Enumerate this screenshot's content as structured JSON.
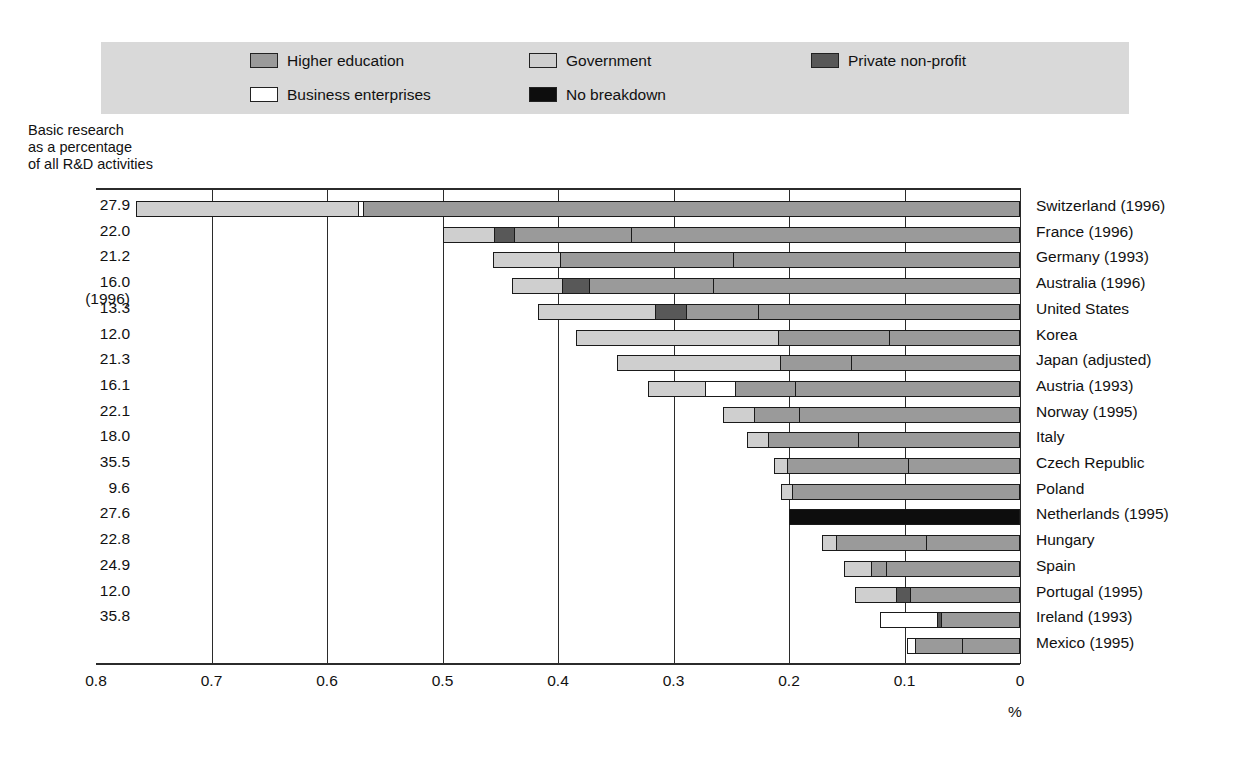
{
  "legend": {
    "items": [
      {
        "label": "Higher education",
        "color": "#9a9a9a",
        "key": "higher_education",
        "col": 0,
        "row": 0
      },
      {
        "label": "Business enterprises",
        "color": "#ffffff",
        "key": "business_enterprises",
        "col": 0,
        "row": 1
      },
      {
        "label": "Government",
        "color": "#cfcfcf",
        "key": "government",
        "col": 1,
        "row": 0
      },
      {
        "label": "No breakdown",
        "color": "#0d0d0d",
        "key": "no_breakdown",
        "col": 1,
        "row": 1
      },
      {
        "label": "Private non-profit",
        "color": "#585858",
        "key": "private_non_profit",
        "col": 2,
        "row": 0
      }
    ],
    "background": "#d9d9d9"
  },
  "axis_caption": "Basic research\nas a percentage\nof all R&D activities",
  "unit_label": "%",
  "chart_data": {
    "type": "bar",
    "title": "Basic research as a percentage of all R&D activities",
    "subtype": "stacked-horizontal",
    "xlabel": "%",
    "ylabel": "",
    "xlim": [
      0.8,
      0.0
    ],
    "xticks": [
      "0.8",
      "0.7",
      "0.6",
      "0.5",
      "0.4",
      "0.3",
      "0.2",
      "0.1",
      "0"
    ],
    "xtick_values": [
      0.8,
      0.7,
      0.6,
      0.5,
      0.4,
      0.3,
      0.2,
      0.1,
      0.0
    ],
    "axis_reversed": true,
    "grid": true,
    "legend_position": "top",
    "series": [
      {
        "name": "Government",
        "color": "#cfcfcf"
      },
      {
        "name": "Private non-profit",
        "color": "#585858"
      },
      {
        "name": "Business enterprises",
        "color": "#ffffff"
      },
      {
        "name": "Higher education",
        "color": "#9a9a9a"
      },
      {
        "name": "No breakdown",
        "color": "#0d0d0d"
      }
    ],
    "categories": [
      "Switzerland (1996)",
      "France (1996)",
      "Germany (1993)",
      "Australia (1996)",
      "United States",
      "Korea",
      "Japan (adjusted)",
      "Austria (1993)",
      "Norway (1995)",
      "Italy",
      "Czech Republic",
      "Poland",
      "Netherlands (1995)",
      "Hungary",
      "Spain",
      "Portugal (1995)",
      "Ireland (1993)",
      "Mexico (1995)"
    ],
    "basic_research_pct": [
      "27.9",
      "22.0",
      "21.2",
      "16.0\n(1996)",
      "13.3",
      "12.0",
      "21.3",
      "16.1",
      "22.1",
      "18.0",
      "35.5",
      "9.6",
      "27.6",
      "22.8",
      "24.9",
      "12.0",
      "35.8"
    ],
    "rows": [
      {
        "country": "Switzerland (1996)",
        "pct_label": "27.9",
        "total": 0.765,
        "segments": [
          {
            "series": "Government",
            "value": 0.191,
            "color": "#cfcfcf"
          },
          {
            "series": "Business enterprises",
            "value": 0.004,
            "color": "#ffffff"
          },
          {
            "series": "Higher education",
            "value": 0.57,
            "color": "#9a9a9a"
          }
        ]
      },
      {
        "country": "France (1996)",
        "pct_label": "22.0",
        "total": 0.5,
        "segments": [
          {
            "series": "Government",
            "value": 0.044,
            "color": "#cfcfcf"
          },
          {
            "series": "Private non-profit",
            "value": 0.017,
            "color": "#585858"
          },
          {
            "series": "Higher education",
            "value": 0.101,
            "color": "#9a9a9a"
          },
          {
            "series": "Higher education",
            "value": 0.338,
            "color": "#9a9a9a"
          }
        ]
      },
      {
        "country": "Germany (1993)",
        "pct_label": "21.2",
        "total": 0.456,
        "segments": [
          {
            "series": "Government",
            "value": 0.057,
            "color": "#cfcfcf"
          },
          {
            "series": "Higher education",
            "value": 0.15,
            "color": "#9a9a9a"
          },
          {
            "series": "Higher education",
            "value": 0.249,
            "color": "#9a9a9a"
          }
        ]
      },
      {
        "country": "Australia (1996)",
        "pct_label": "16.0\n(1996)",
        "total": 0.44,
        "segments": [
          {
            "series": "Government",
            "value": 0.043,
            "color": "#cfcfcf"
          },
          {
            "series": "Private non-profit",
            "value": 0.023,
            "color": "#585858"
          },
          {
            "series": "Higher education",
            "value": 0.107,
            "color": "#9a9a9a"
          },
          {
            "series": "Higher education",
            "value": 0.267,
            "color": "#9a9a9a"
          }
        ]
      },
      {
        "country": "United States",
        "pct_label": "13.3",
        "total": 0.417,
        "segments": [
          {
            "series": "Government",
            "value": 0.1,
            "color": "#cfcfcf"
          },
          {
            "series": "Private non-profit",
            "value": 0.027,
            "color": "#585858"
          },
          {
            "series": "Higher education",
            "value": 0.062,
            "color": "#9a9a9a"
          },
          {
            "series": "Higher education",
            "value": 0.228,
            "color": "#9a9a9a"
          }
        ]
      },
      {
        "country": "Korea",
        "pct_label": "12.0",
        "total": 0.384,
        "segments": [
          {
            "series": "Government",
            "value": 0.174,
            "color": "#cfcfcf"
          },
          {
            "series": "Higher education",
            "value": 0.096,
            "color": "#9a9a9a"
          },
          {
            "series": "Higher education",
            "value": 0.114,
            "color": "#9a9a9a"
          }
        ]
      },
      {
        "country": "Japan (adjusted)",
        "pct_label": "21.3",
        "total": 0.349,
        "segments": [
          {
            "series": "Government",
            "value": 0.14,
            "color": "#cfcfcf"
          },
          {
            "series": "Higher education",
            "value": 0.062,
            "color": "#9a9a9a"
          },
          {
            "series": "Higher education",
            "value": 0.147,
            "color": "#9a9a9a"
          }
        ]
      },
      {
        "country": "Austria (1993)",
        "pct_label": "16.1",
        "total": 0.322,
        "segments": [
          {
            "series": "Government",
            "value": 0.048,
            "color": "#cfcfcf"
          },
          {
            "series": "Business enterprises",
            "value": 0.026,
            "color": "#ffffff"
          },
          {
            "series": "Higher education",
            "value": 0.052,
            "color": "#9a9a9a"
          },
          {
            "series": "Higher education",
            "value": 0.196,
            "color": "#9a9a9a"
          }
        ]
      },
      {
        "country": "Norway (1995)",
        "pct_label": "22.1",
        "total": 0.257,
        "segments": [
          {
            "series": "Government",
            "value": 0.026,
            "color": "#cfcfcf"
          },
          {
            "series": "Higher education",
            "value": 0.039,
            "color": "#9a9a9a"
          },
          {
            "series": "Higher education",
            "value": 0.192,
            "color": "#9a9a9a"
          }
        ]
      },
      {
        "country": "Italy",
        "pct_label": "18.0",
        "total": 0.236,
        "segments": [
          {
            "series": "Government",
            "value": 0.017,
            "color": "#cfcfcf"
          },
          {
            "series": "Higher education",
            "value": 0.078,
            "color": "#9a9a9a"
          },
          {
            "series": "Higher education",
            "value": 0.141,
            "color": "#9a9a9a"
          }
        ]
      },
      {
        "country": "Czech Republic",
        "pct_label": "35.5",
        "total": 0.213,
        "segments": [
          {
            "series": "Government",
            "value": 0.01,
            "color": "#cfcfcf"
          },
          {
            "series": "Higher education",
            "value": 0.105,
            "color": "#9a9a9a"
          },
          {
            "series": "Higher education",
            "value": 0.098,
            "color": "#9a9a9a"
          }
        ]
      },
      {
        "country": "Poland",
        "pct_label": "9.6",
        "total": 0.207,
        "segments": [
          {
            "series": "Government",
            "value": 0.009,
            "color": "#cfcfcf"
          },
          {
            "series": "Higher education",
            "value": 0.198,
            "color": "#9a9a9a"
          }
        ]
      },
      {
        "country": "Netherlands (1995)",
        "pct_label": "27.6",
        "total": 0.2,
        "segments": [
          {
            "series": "No breakdown",
            "value": 0.2,
            "color": "#0d0d0d"
          }
        ]
      },
      {
        "country": "Hungary",
        "pct_label": "22.8",
        "total": 0.171,
        "segments": [
          {
            "series": "Government",
            "value": 0.011,
            "color": "#cfcfcf"
          },
          {
            "series": "Higher education",
            "value": 0.078,
            "color": "#9a9a9a"
          },
          {
            "series": "Higher education",
            "value": 0.082,
            "color": "#9a9a9a"
          }
        ]
      },
      {
        "country": "Spain",
        "pct_label": "24.9",
        "total": 0.152,
        "segments": [
          {
            "series": "Government",
            "value": 0.022,
            "color": "#cfcfcf"
          },
          {
            "series": "Higher education",
            "value": 0.013,
            "color": "#9a9a9a"
          },
          {
            "series": "Higher education",
            "value": 0.117,
            "color": "#9a9a9a"
          }
        ]
      },
      {
        "country": "Portugal (1995)",
        "pct_label": "12.0",
        "total": 0.143,
        "segments": [
          {
            "series": "Government",
            "value": 0.035,
            "color": "#cfcfcf"
          },
          {
            "series": "Private non-profit",
            "value": 0.012,
            "color": "#585858"
          },
          {
            "series": "Higher education",
            "value": 0.096,
            "color": "#9a9a9a"
          }
        ]
      },
      {
        "country": "Ireland (1993)",
        "pct_label": "35.8",
        "total": 0.121,
        "segments": [
          {
            "series": "Business enterprises",
            "value": 0.048,
            "color": "#ffffff"
          },
          {
            "series": "Private non-profit",
            "value": 0.004,
            "color": "#585858"
          },
          {
            "series": "Higher education",
            "value": 0.069,
            "color": "#9a9a9a"
          }
        ]
      },
      {
        "country": "Mexico (1995)",
        "pct_label": "",
        "total": 0.098,
        "segments": [
          {
            "series": "Business enterprises",
            "value": 0.006,
            "color": "#ffffff"
          },
          {
            "series": "Higher education",
            "value": 0.041,
            "color": "#9a9a9a"
          },
          {
            "series": "Higher education",
            "value": 0.051,
            "color": "#9a9a9a"
          }
        ]
      }
    ]
  }
}
